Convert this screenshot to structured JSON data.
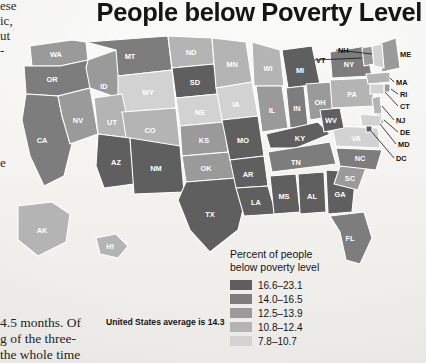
{
  "title": "People below Poverty Level",
  "legend": {
    "title_line1": "Percent of people",
    "title_line2": "below poverty level",
    "items": [
      {
        "range": "16.6–23.1",
        "color": "#5e5e5e"
      },
      {
        "range": "14.0–16.5",
        "color": "#7d7d7d"
      },
      {
        "range": "12.5–13.9",
        "color": "#9a9a9a"
      },
      {
        "range": "10.8–12.4",
        "color": "#b4b4b4"
      },
      {
        "range": "7.8–10.7",
        "color": "#d2d2d2"
      }
    ]
  },
  "us_average_note": "United States average is 14.3",
  "book_text": {
    "left_fragments": [
      "ese",
      "ic,",
      "ut",
      "-",
      "e"
    ],
    "bottom_lines": [
      "4.5  months.  Of",
      "g of the three-",
      "the whole time"
    ]
  },
  "chart_data": {
    "type": "map",
    "title": "People below Poverty Level",
    "value_label": "Percent of people below poverty level",
    "national_average": 14.3,
    "bins": [
      {
        "range": "16.6–23.1",
        "min": 16.6,
        "max": 23.1,
        "color": "#5e5e5e"
      },
      {
        "range": "14.0–16.5",
        "min": 14.0,
        "max": 16.5,
        "color": "#7d7d7d"
      },
      {
        "range": "12.5–13.9",
        "min": 12.5,
        "max": 13.9,
        "color": "#9a9a9a"
      },
      {
        "range": "10.8–12.4",
        "min": 10.8,
        "max": 12.4,
        "color": "#b4b4b4"
      },
      {
        "range": "7.8–10.7",
        "min": 7.8,
        "max": 10.7,
        "color": "#d2d2d2"
      }
    ],
    "states": [
      {
        "code": "WA",
        "bin": 2
      },
      {
        "code": "OR",
        "bin": 1
      },
      {
        "code": "CA",
        "bin": 1
      },
      {
        "code": "ID",
        "bin": 2
      },
      {
        "code": "NV",
        "bin": 2
      },
      {
        "code": "MT",
        "bin": 1
      },
      {
        "code": "WY",
        "bin": 4
      },
      {
        "code": "UT",
        "bin": 3
      },
      {
        "code": "CO",
        "bin": 3
      },
      {
        "code": "AZ",
        "bin": 0
      },
      {
        "code": "NM",
        "bin": 0
      },
      {
        "code": "ND",
        "bin": 3
      },
      {
        "code": "SD",
        "bin": 0
      },
      {
        "code": "NE",
        "bin": 4
      },
      {
        "code": "KS",
        "bin": 2
      },
      {
        "code": "OK",
        "bin": 2
      },
      {
        "code": "TX",
        "bin": 0
      },
      {
        "code": "MN",
        "bin": 3
      },
      {
        "code": "IA",
        "bin": 4
      },
      {
        "code": "MO",
        "bin": 0
      },
      {
        "code": "AR",
        "bin": 0
      },
      {
        "code": "LA",
        "bin": 0
      },
      {
        "code": "WI",
        "bin": 3
      },
      {
        "code": "IL",
        "bin": 2
      },
      {
        "code": "MI",
        "bin": 0
      },
      {
        "code": "IN",
        "bin": 1
      },
      {
        "code": "OH",
        "bin": 2
      },
      {
        "code": "KY",
        "bin": 0
      },
      {
        "code": "TN",
        "bin": 1
      },
      {
        "code": "MS",
        "bin": 0
      },
      {
        "code": "AL",
        "bin": 0
      },
      {
        "code": "GA",
        "bin": 0
      },
      {
        "code": "FL",
        "bin": 1
      },
      {
        "code": "SC",
        "bin": 2
      },
      {
        "code": "NC",
        "bin": 1
      },
      {
        "code": "VA",
        "bin": 4
      },
      {
        "code": "WV",
        "bin": 0
      },
      {
        "code": "PA",
        "bin": 3
      },
      {
        "code": "NY",
        "bin": 1
      },
      {
        "code": "ME",
        "bin": 2
      },
      {
        "code": "VT",
        "bin": 2
      },
      {
        "code": "NH",
        "bin": 4
      },
      {
        "code": "MA",
        "bin": 3
      },
      {
        "code": "RI",
        "bin": 2
      },
      {
        "code": "CT",
        "bin": 4
      },
      {
        "code": "NJ",
        "bin": 3
      },
      {
        "code": "DE",
        "bin": 3
      },
      {
        "code": "MD",
        "bin": 4
      },
      {
        "code": "DC",
        "bin": 0
      },
      {
        "code": "AK",
        "bin": 3
      },
      {
        "code": "HI",
        "bin": 3
      }
    ],
    "outside_labels": [
      "NH",
      "VT",
      "ME",
      "MA",
      "RI",
      "CT",
      "NJ",
      "DE",
      "MD",
      "DC"
    ]
  }
}
